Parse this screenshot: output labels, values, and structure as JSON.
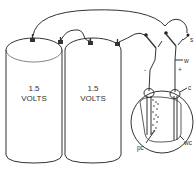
{
  "diagram": {
    "batteries": [
      {
        "voltage_line1": "1.5",
        "voltage_line2": "VOLTS"
      },
      {
        "voltage_line1": "1.5",
        "voltage_line2": "VOLTS"
      }
    ],
    "labels": {
      "switch": "s",
      "wire": "w",
      "connector": "c",
      "water_container": "wc",
      "plate_coating": "pc",
      "minus": "-",
      "plus": "+"
    }
  }
}
